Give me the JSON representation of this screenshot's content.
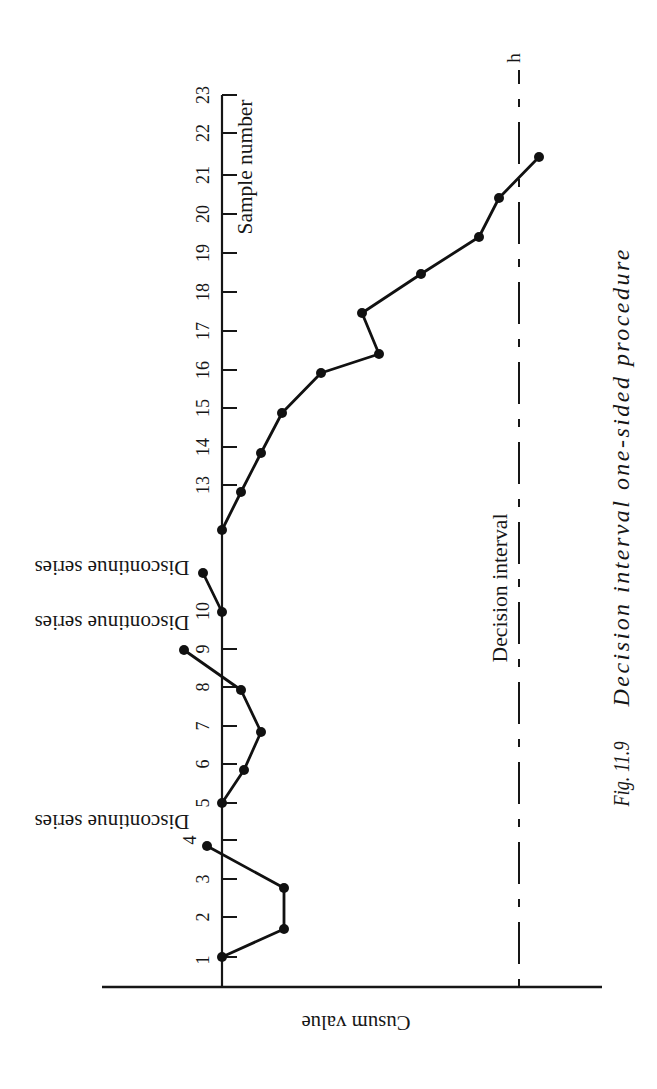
{
  "chart_data": {
    "type": "line",
    "figure_number": "Fig. 11.9",
    "title": "Decision interval one-sided procedure",
    "xlabel": "Sample number",
    "ylabel": "Cusum value",
    "layout_hint": "figure rotated: sample number runs bottom-to-top, cusum value increases left-to-right",
    "xlim": [
      1,
      23
    ],
    "ylim": [
      -12,
      38
    ],
    "grid": false,
    "legend": null,
    "x_tick_marks": [
      1,
      2,
      3,
      4,
      5,
      6,
      7,
      8,
      9,
      13,
      14,
      15,
      16,
      17,
      18,
      19,
      20,
      21,
      22,
      23
    ],
    "x_tick_values": [
      1,
      2,
      3,
      4,
      5,
      6,
      7,
      8,
      9,
      10,
      13,
      14,
      15,
      16,
      17,
      18,
      19,
      20,
      21,
      22,
      23
    ],
    "x_tick_labels": [
      "1",
      "2",
      "3",
      "4",
      "5",
      "6",
      "7",
      "8",
      "9",
      "10",
      "13",
      "14",
      "15",
      "16",
      "17",
      "18",
      "19",
      "20",
      "21",
      "22",
      "23"
    ],
    "series": [
      {
        "name": "Cusum",
        "x": [
          1,
          2,
          3,
          4,
          5,
          6,
          7,
          8,
          9,
          10,
          11,
          12,
          13,
          14,
          15,
          16,
          17,
          18,
          19,
          20,
          21,
          22
        ],
        "y": [
          0,
          6.2,
          6.2,
          -1.5,
          0,
          2.2,
          3.9,
          1.9,
          -3.8,
          0,
          -1.9,
          0,
          1.9,
          3.9,
          6.0,
          9.9,
          15.7,
          14.0,
          19.9,
          25.7,
          27.7,
          31.7
        ],
        "breaks_after": [
          4,
          9,
          11
        ]
      }
    ],
    "reference_lines": [
      {
        "label": "Decision interval",
        "symbol": "h",
        "value": 29.7,
        "style": "dash-dot"
      }
    ],
    "annotations": [
      {
        "text": "Discontinue series",
        "x": 4
      },
      {
        "text": "Discontinue series",
        "x": 9
      },
      {
        "text": "Discontinue series",
        "x": 11
      }
    ]
  }
}
